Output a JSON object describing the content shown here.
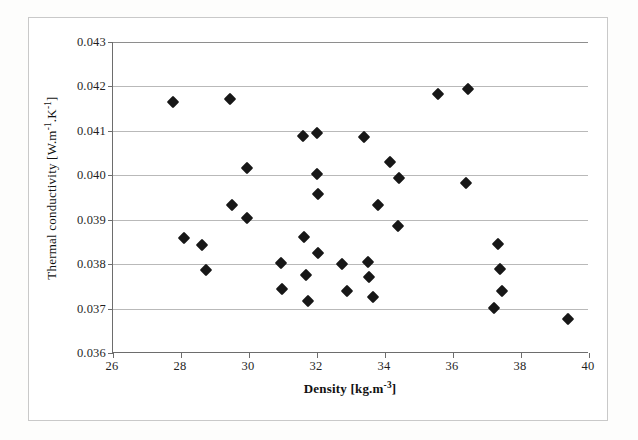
{
  "chart_data": {
    "type": "scatter",
    "title": "",
    "xlabel": "Density [kg.m-3]",
    "ylabel": "Thermal conductivity [W.m-1.K-1]",
    "xlabel_parts": {
      "text": "Density [kg.m",
      "sup": "-3",
      "tail": "]"
    },
    "ylabel_parts": {
      "text": "Thermal conductivity [W.m",
      "sup1": "-1",
      "mid": ".K",
      "sup2": "-1",
      "tail": "]"
    },
    "xlim": [
      26,
      40
    ],
    "ylim": [
      0.036,
      0.043
    ],
    "xticks": [
      26,
      28,
      30,
      32,
      34,
      36,
      38,
      40
    ],
    "yticks": [
      0.036,
      0.037,
      0.038,
      0.039,
      0.04,
      0.041,
      0.042,
      0.043
    ],
    "xticklabels": [
      "26",
      "28",
      "30",
      "32",
      "34",
      "36",
      "38",
      "40"
    ],
    "yticklabels": [
      "0.036",
      "0.037",
      "0.038",
      "0.039",
      "0.040",
      "0.041",
      "0.042",
      "0.043"
    ],
    "grid": "horizontal",
    "legend": null,
    "marker": "filled-diamond",
    "marker_color": "#171717",
    "series": [
      {
        "name": "measurements",
        "points": [
          [
            27.77,
            0.04164
          ],
          [
            28.1,
            0.03858
          ],
          [
            28.61,
            0.03844
          ],
          [
            28.73,
            0.03786
          ],
          [
            29.45,
            0.04171
          ],
          [
            29.5,
            0.03932
          ],
          [
            29.95,
            0.03904
          ],
          [
            29.93,
            0.04016
          ],
          [
            30.94,
            0.03803
          ],
          [
            30.98,
            0.03743
          ],
          [
            31.58,
            0.04088
          ],
          [
            31.63,
            0.03862
          ],
          [
            31.68,
            0.03776
          ],
          [
            31.74,
            0.03718
          ],
          [
            32.0,
            0.04096
          ],
          [
            32.01,
            0.04003
          ],
          [
            32.04,
            0.03957
          ],
          [
            32.02,
            0.03824
          ],
          [
            32.73,
            0.038
          ],
          [
            32.88,
            0.03739
          ],
          [
            33.39,
            0.04087
          ],
          [
            33.5,
            0.03804
          ],
          [
            33.53,
            0.0377
          ],
          [
            33.66,
            0.03726
          ],
          [
            33.78,
            0.03934
          ],
          [
            34.15,
            0.0403
          ],
          [
            34.37,
            0.03886
          ],
          [
            34.4,
            0.03994
          ],
          [
            35.55,
            0.04182
          ],
          [
            36.38,
            0.03982
          ],
          [
            36.44,
            0.04194
          ],
          [
            37.2,
            0.03702
          ],
          [
            37.32,
            0.03845
          ],
          [
            37.38,
            0.03789
          ],
          [
            37.45,
            0.0374
          ],
          [
            39.37,
            0.03677
          ]
        ]
      }
    ]
  },
  "axes": {
    "plot_left_px": 112,
    "plot_top_px": 42,
    "plot_width_px": 476,
    "plot_height_px": 311
  }
}
